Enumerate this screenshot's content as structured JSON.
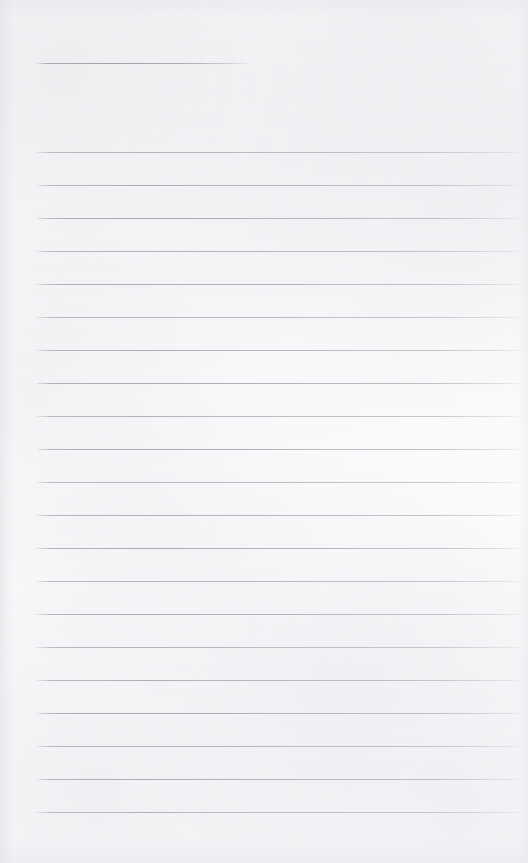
{
  "document": {
    "kind": "scanned-blank-ruled-page",
    "title": "",
    "body_text": "",
    "page_width": 528,
    "page_height": 863,
    "paper_color": "#fcfcfd",
    "rule_color": "#aaaab3",
    "has_visible_text": false,
    "notes": ""
  },
  "header_rule": {
    "name": "header-rule",
    "x": 37,
    "y": 63,
    "width": 214,
    "thickness": 1,
    "color": "#a0a0ab"
  },
  "ruled_lines": {
    "count": 21,
    "left_x": 37,
    "right_x": 522,
    "width": 485,
    "first_y": 152,
    "spacing": 32.95,
    "thickness": 1,
    "color": "#aaaab3",
    "y_positions": [
      152,
      185,
      218,
      251,
      284,
      317,
      350,
      383,
      416,
      449,
      482,
      515,
      548,
      581,
      614,
      647,
      680,
      713,
      746,
      779,
      812
    ]
  },
  "margins": {
    "left": 37,
    "right": 6,
    "top_to_header_rule": 63,
    "header_rule_to_first_line": 89,
    "last_line_to_bottom": 51
  }
}
